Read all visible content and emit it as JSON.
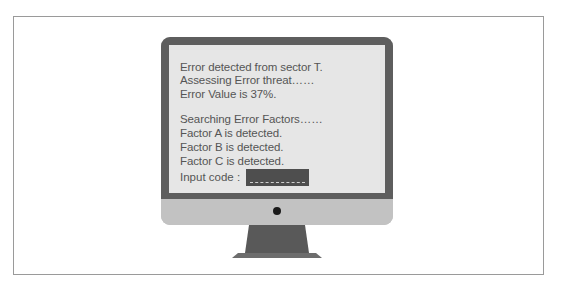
{
  "terminal": {
    "lines": [
      "Error detected from sector T.",
      "Assessing Error threat……",
      "Error Value is 37%.",
      "Searching Error Factors……",
      "Factor A is detected.",
      "Factor B is detected.",
      "Factor C is detected."
    ],
    "input_label": "Input code :",
    "input_value": ""
  },
  "colors": {
    "bezel": "#5e5e5e",
    "screen": "#e6e6e6",
    "chin": "#c2c2c2",
    "stand": "#595959",
    "input_box": "#4e4e4e"
  }
}
